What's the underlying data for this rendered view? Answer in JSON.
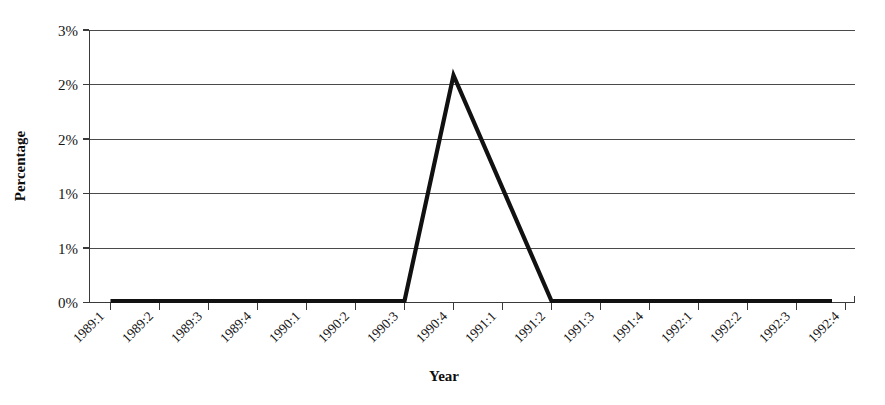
{
  "chart_data": {
    "type": "line",
    "title": "",
    "subtitle": "",
    "xlabel": "Year",
    "ylabel": "Percentage",
    "grid": true,
    "legend": false,
    "legend_position": "none",
    "series_color": "#111111",
    "categories": [
      "1989:1",
      "1989:2",
      "1989:3",
      "1989:4",
      "1990:1",
      "1990:2",
      "1990:3",
      "1990:4",
      "1991:1",
      "1991:2",
      "1991:3",
      "1991:4",
      "1992:1",
      "1992:2",
      "1992:3",
      "1992:4"
    ],
    "values": [
      0,
      0,
      0,
      0,
      0,
      0,
      0,
      2.5,
      1.25,
      0,
      0,
      0,
      0,
      0,
      0,
      0
    ],
    "ylim": [
      0,
      3
    ],
    "y_tick_values": [
      0,
      0.5,
      1,
      1.5,
      2,
      2.5,
      3
    ],
    "y_tick_labels_top_to_bottom": [
      "3%",
      "2%",
      "2%",
      "1%",
      "1%",
      "0%"
    ],
    "y_tick_labels": [
      "0%",
      "1%",
      "1%",
      "2%",
      "2%",
      "3%"
    ],
    "y_tick_format": "percent-rounded",
    "series": [
      {
        "name": "Percentage",
        "values": [
          0,
          0,
          0,
          0,
          0,
          0,
          0,
          2.5,
          1.25,
          0,
          0,
          0,
          0,
          0,
          0,
          0
        ]
      }
    ],
    "annotations": [],
    "peak": {
      "category": "1990:4",
      "value": 2.5,
      "displayed_label": "2%"
    }
  },
  "axis_titles": {
    "x": "Year",
    "y": "Percentage"
  }
}
